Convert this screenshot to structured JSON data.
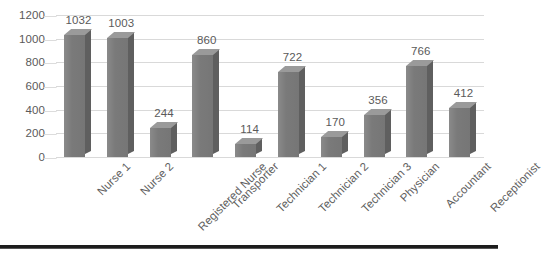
{
  "chart_data": {
    "type": "bar",
    "title": "",
    "subtitle": "",
    "xlabel": "",
    "ylabel": "",
    "ylim": [
      0,
      1200
    ],
    "ytick_step": 200,
    "yticks": [
      "1200",
      "1000",
      "800",
      "600",
      "400",
      "200",
      "0"
    ],
    "grid": true,
    "legend": false,
    "legend_position": "none",
    "style": "3d-column",
    "data_labels": true,
    "categories": [
      "Nurse 1",
      "Nurse 2",
      "Registered Nurse",
      "Transporter",
      "Technician 1",
      "Technician 2",
      "Technician 3",
      "Physician",
      "Accountant",
      "Receptionist"
    ],
    "values": [
      1032,
      1003,
      244,
      860,
      114,
      722,
      170,
      356,
      766,
      412
    ],
    "value_labels": [
      "1032",
      "1003",
      "244",
      "860",
      "114",
      "722",
      "170",
      "356",
      "766",
      "412"
    ],
    "colors": {
      "bar_front": "#7b7b7b",
      "bar_side": "#5f5f5f",
      "bar_top": "#9a9a9a",
      "gridline": "#d9d9d9",
      "axis_text": "#5a5a5a",
      "bottom_rule": "#1d1d1d",
      "background": "#ffffff"
    }
  }
}
